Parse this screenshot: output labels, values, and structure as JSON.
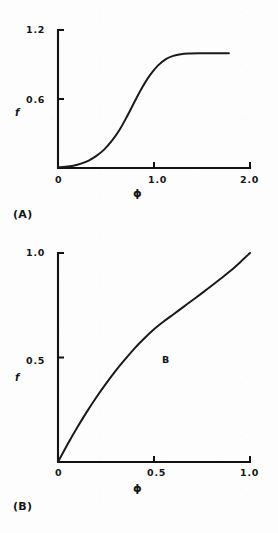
{
  "page": {
    "background_color": "#fdfdfd",
    "ink_color": "#141414",
    "width": 278,
    "height": 533
  },
  "panels": [
    {
      "tag": "(A)",
      "tag_name": "panel-a-caption",
      "chart_data": {
        "type": "line",
        "title": "",
        "xlabel": "ϕ",
        "ylabel": "f",
        "xlim": [
          0,
          2.0
        ],
        "ylim": [
          0,
          1.2
        ],
        "xticks": [
          0,
          1.0,
          2.0
        ],
        "xticklabels": [
          "0",
          "1.0",
          "2.0"
        ],
        "yticks": [
          0.6,
          1.2
        ],
        "yticklabels": [
          "0.6",
          "1.2"
        ],
        "grid": false,
        "legend": "none",
        "annotations": [],
        "series": [
          {
            "name": "f(ϕ) sigmoid",
            "x": [
              0.0,
              0.08,
              0.16,
              0.24,
              0.32,
              0.4,
              0.48,
              0.56,
              0.64,
              0.72,
              0.8,
              0.88,
              0.96,
              1.04,
              1.12,
              1.2,
              1.28,
              1.36,
              1.5,
              1.65,
              1.78
            ],
            "y": [
              0.005,
              0.01,
              0.02,
              0.038,
              0.065,
              0.105,
              0.16,
              0.235,
              0.33,
              0.45,
              0.58,
              0.705,
              0.81,
              0.89,
              0.945,
              0.975,
              0.99,
              0.995,
              0.997,
              0.998,
              0.998
            ]
          }
        ]
      }
    },
    {
      "tag": "(B)",
      "tag_name": "panel-b-caption",
      "chart_data": {
        "type": "line",
        "title": "",
        "xlabel": "ϕ",
        "ylabel": "f",
        "xlim": [
          0,
          1.0
        ],
        "ylim": [
          0,
          1.0
        ],
        "xticks": [
          0,
          0.5,
          1.0
        ],
        "xticklabels": [
          "0",
          "0.5",
          "1.0"
        ],
        "yticks": [
          0.5,
          1.0
        ],
        "yticklabels": [
          "0.5",
          "1.0"
        ],
        "grid": false,
        "legend": "none",
        "annotations": [
          {
            "text": "B",
            "x": 0.55,
            "y": 0.49
          }
        ],
        "series": [
          {
            "name": "f(ϕ) concave-then-steep",
            "x": [
              0.0,
              0.05,
              0.1,
              0.15,
              0.2,
              0.25,
              0.3,
              0.35,
              0.4,
              0.45,
              0.5,
              0.55,
              0.6,
              0.65,
              0.7,
              0.75,
              0.8,
              0.85,
              0.9,
              0.95,
              1.0
            ],
            "y": [
              0.0,
              0.085,
              0.165,
              0.24,
              0.31,
              0.375,
              0.436,
              0.492,
              0.545,
              0.592,
              0.635,
              0.672,
              0.706,
              0.74,
              0.774,
              0.808,
              0.843,
              0.879,
              0.916,
              0.957,
              1.0
            ]
          }
        ]
      }
    }
  ]
}
